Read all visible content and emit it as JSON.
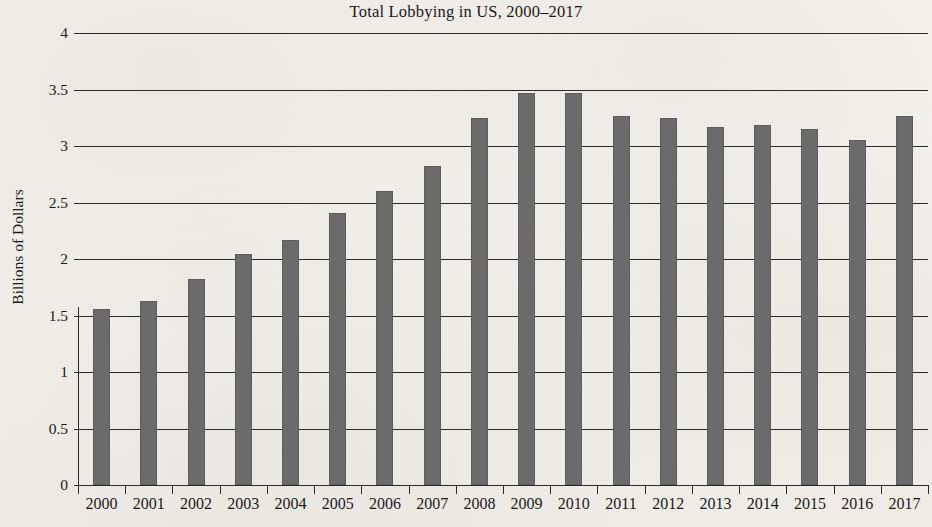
{
  "chart_data": {
    "type": "bar",
    "title": "Total Lobbying in US, 2000–2017",
    "xlabel": "",
    "ylabel": "Billions of Dollars",
    "categories": [
      "2000",
      "2001",
      "2002",
      "2003",
      "2004",
      "2005",
      "2006",
      "2007",
      "2008",
      "2009",
      "2010",
      "2011",
      "2012",
      "2013",
      "2014",
      "2015",
      "2016",
      "2017"
    ],
    "values": [
      1.56,
      1.63,
      1.82,
      2.04,
      2.17,
      2.41,
      2.6,
      2.82,
      3.25,
      3.47,
      3.47,
      3.27,
      3.25,
      3.17,
      3.19,
      3.15,
      3.05,
      3.27
    ],
    "ylim": [
      0,
      4
    ],
    "ytick_labels": [
      "0",
      "0.5",
      "1",
      "1.5",
      "2",
      "2.5",
      "3",
      "3.5",
      "4"
    ],
    "ytick_values": [
      0,
      0.5,
      1,
      1.5,
      2,
      2.5,
      3,
      3.5,
      4
    ],
    "grid": true,
    "legend": false,
    "bar_color": "#6b6b6b",
    "axis_color": "#2b2b2b",
    "background_color": "#f3f1ec"
  }
}
